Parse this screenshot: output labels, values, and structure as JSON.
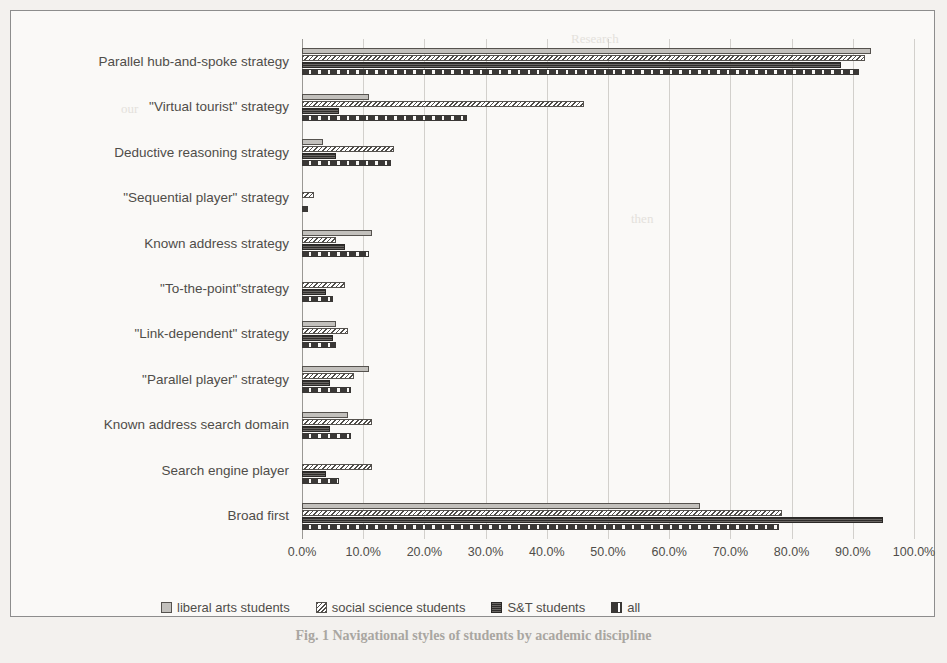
{
  "figure": {
    "caption": "Fig. 1  Navigational styles of students by academic discipline"
  },
  "legend": {
    "position": "bottom",
    "items": [
      {
        "label": "liberal arts students",
        "icon": "swatch-solid-light",
        "color": "#c2c0bc"
      },
      {
        "label": "social science students",
        "icon": "swatch-dotted",
        "color": "#4f4d49"
      },
      {
        "label": "S&T students",
        "icon": "swatch-hatched-dark",
        "color": "#3a3836"
      },
      {
        "label": "all",
        "icon": "swatch-dashed-dark",
        "color": "#3a3836"
      }
    ]
  },
  "chart_data": {
    "type": "bar",
    "orientation": "horizontal",
    "title": "",
    "xlabel": "",
    "ylabel": "",
    "xlim": [
      0,
      100
    ],
    "xticks": [
      0,
      10,
      20,
      30,
      40,
      50,
      60,
      70,
      80,
      90,
      100
    ],
    "tick_labels": [
      "0.0%",
      "10.0%",
      "20.0%",
      "30.0%",
      "40.0%",
      "50.0%",
      "60.0%",
      "70.0%",
      "80.0%",
      "90.0%",
      "100.0%"
    ],
    "grid": true,
    "categories": [
      "Parallel hub-and-spoke strategy",
      "\"Virtual tourist\" strategy",
      "Deductive reasoning strategy",
      "\"Sequential player\" strategy",
      "Known address strategy",
      "\"To-the-point\"strategy",
      "\"Link-dependent\" strategy",
      "\"Parallel player\" strategy",
      "Known address search domain",
      "Search engine player",
      "Broad first"
    ],
    "series": [
      {
        "name": "liberal arts students",
        "values": [
          93.0,
          11.0,
          3.5,
          0.0,
          11.5,
          0.0,
          5.5,
          11.0,
          7.5,
          0.0,
          65.0
        ]
      },
      {
        "name": "social science students",
        "values": [
          92.0,
          46.0,
          15.0,
          2.0,
          5.5,
          7.0,
          7.5,
          8.5,
          11.5,
          11.5,
          78.5
        ]
      },
      {
        "name": "S&T students",
        "values": [
          88.0,
          6.0,
          5.5,
          0.0,
          7.0,
          4.0,
          5.0,
          4.5,
          4.5,
          4.0,
          95.0
        ]
      },
      {
        "name": "all",
        "values": [
          91.0,
          27.0,
          14.5,
          1.0,
          11.0,
          5.0,
          5.5,
          8.0,
          8.0,
          6.0,
          78.0
        ]
      }
    ]
  }
}
